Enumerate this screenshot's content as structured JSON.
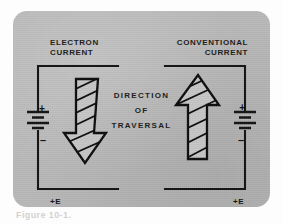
{
  "figure": {
    "panel_color": "#b9b9b9",
    "ink_color": "#141414",
    "caption": "Figure 10-1."
  },
  "labels": {
    "electron_current": "ELECTRON\nCURRENT",
    "conventional_current": "CONVENTIONAL\nCURRENT",
    "direction": "DIRECTION",
    "of": "OF",
    "traversal": "TRAVERSAL"
  },
  "left_circuit": {
    "name": "electron-current-circuit",
    "battery_plus": "+",
    "battery_minus": "–",
    "source_label": "+E",
    "arrow_direction": "down"
  },
  "right_circuit": {
    "name": "conventional-current-circuit",
    "battery_plus": "+",
    "battery_minus": "–",
    "source_label": "+E",
    "arrow_direction": "up"
  }
}
